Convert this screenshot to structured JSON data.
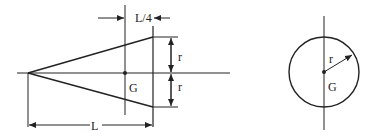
{
  "figure": {
    "cone": {
      "length_label": "L",
      "quarter_label": "L/4",
      "radius_label_top": "r",
      "radius_label_bottom": "r",
      "centroid_label": "G"
    },
    "circle": {
      "radius_label": "r",
      "centroid_label": "G"
    },
    "colors": {
      "line": "#222222",
      "background": "#ffffff"
    }
  }
}
